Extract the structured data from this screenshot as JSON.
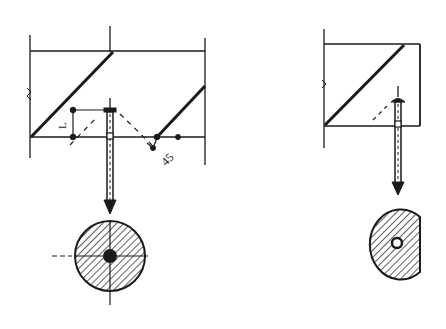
{
  "figure": {
    "left_diagram": {
      "labels": {
        "dimension_L": "L",
        "angle": "45"
      }
    },
    "right_diagram": {},
    "colors": {
      "ink": "#1a1a1a",
      "background": "#ffffff"
    },
    "caption": {
      "text": ""
    }
  }
}
